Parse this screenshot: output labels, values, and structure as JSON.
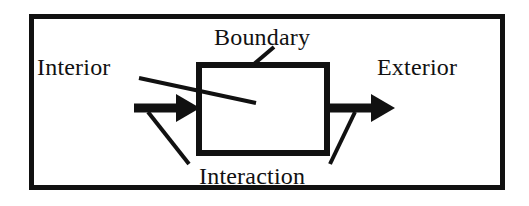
{
  "figure": {
    "type": "system-boundary-diagram",
    "background_color": "#ffffff",
    "ink_color": "#111111",
    "outer_frame": {
      "name": "outer-frame",
      "x": 29,
      "y": 14,
      "width": 476,
      "height": 176,
      "stroke_width": 5
    },
    "system_box": {
      "name": "system-box",
      "label_ref": "boundary",
      "x": 196,
      "y": 62,
      "width": 134,
      "height": 94,
      "stroke_width": 6
    },
    "labels": {
      "interior": "Interior",
      "boundary": "Boundary",
      "exterior": "Exterior",
      "interaction": "Interaction"
    },
    "arrows": [
      {
        "name": "inbound-interaction-arrow",
        "direction": "right",
        "from_x": 134,
        "to_x": 200,
        "y": 108,
        "shaft_width": 9,
        "head_length": 22,
        "head_half_height": 14
      },
      {
        "name": "outbound-interaction-arrow",
        "direction": "right",
        "from_x": 330,
        "to_x": 395,
        "y": 108,
        "shaft_width": 9,
        "head_length": 22,
        "head_half_height": 14
      }
    ],
    "leader_lines": [
      {
        "name": "boundary-leader-line",
        "from_label": "boundary",
        "x1": 274,
        "y1": 47,
        "x2": 254,
        "y2": 64,
        "stroke_width": 4
      },
      {
        "name": "interior-leader-line",
        "from_label": "interior",
        "x1": 139,
        "y1": 78,
        "x2": 256,
        "y2": 103,
        "stroke_width": 4
      },
      {
        "name": "interaction-leader-line-left",
        "from_label": "interaction",
        "x1": 189,
        "y1": 164,
        "x2": 148,
        "y2": 112,
        "stroke_width": 4
      },
      {
        "name": "interaction-leader-line-right",
        "from_label": "interaction",
        "x1": 330,
        "y1": 164,
        "x2": 355,
        "y2": 112,
        "stroke_width": 4
      }
    ]
  }
}
